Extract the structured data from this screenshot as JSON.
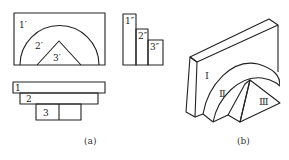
{
  "figure_a": {
    "caption": "(a)",
    "front_view": {
      "labels": {
        "part1": "1′",
        "part2": "2′",
        "part3": "3′"
      }
    },
    "side_view": {
      "labels": {
        "part1": "1″",
        "part2": "2″",
        "part3": "3″"
      }
    },
    "top_view": {
      "labels": {
        "part1": "1",
        "part2": "2",
        "part3": "3"
      }
    }
  },
  "figure_b": {
    "caption": "(b)",
    "labels": {
      "part1": "Ⅰ",
      "part2": "Ⅱ",
      "part3": "Ⅲ"
    }
  },
  "colors": {
    "stroke": "#222222",
    "background": "#ffffff"
  }
}
